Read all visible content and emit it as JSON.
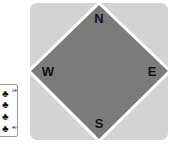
{
  "table": {
    "background_color": "#d3d3d3",
    "diamond_color": "#7b7b7b",
    "diamond_border_color": "#ffffff"
  },
  "seats": {
    "north": "N",
    "east": "E",
    "south": "S",
    "west": "W"
  },
  "card": {
    "suit": "clubs",
    "suit_glyph": "♣",
    "corner_label": "4♣",
    "pips": [
      "♣",
      "♣",
      "♣",
      "♣"
    ]
  }
}
